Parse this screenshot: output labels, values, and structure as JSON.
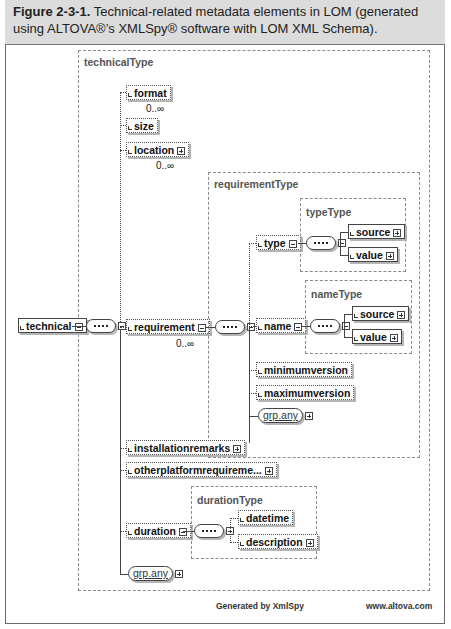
{
  "caption": {
    "figure_label": "Figure 2-3-1.",
    "text": "Technical-related metadata elements in LOM (generated using ALTOVA®’s XMLSpy® software with LOM XML Schema)."
  },
  "diagram": {
    "root": {
      "name": "technical"
    },
    "technicalType": {
      "label": "technicalType",
      "elements": {
        "format": {
          "name": "format",
          "cardinality": "0..∞"
        },
        "size": {
          "name": "size"
        },
        "location": {
          "name": "location",
          "cardinality": "0..∞"
        },
        "requirement": {
          "name": "requirement",
          "cardinality": "0..∞"
        },
        "installationremarks": {
          "name": "installationremarks"
        },
        "otherplatformrequirements": {
          "name": "otherplatformrequireme..."
        },
        "duration": {
          "name": "duration"
        },
        "grp_any": {
          "name": "grp.any"
        }
      }
    },
    "requirementType": {
      "label": "requirementType",
      "elements": {
        "type": {
          "name": "type"
        },
        "name": {
          "name": "name"
        },
        "minimumversion": {
          "name": "minimumversion"
        },
        "maximumversion": {
          "name": "maximumversion"
        },
        "grp_any": {
          "name": "grp.any"
        }
      }
    },
    "typeType": {
      "label": "typeType",
      "source": "source",
      "value": "value"
    },
    "nameType": {
      "label": "nameType",
      "source": "source",
      "value": "value"
    },
    "durationType": {
      "label": "durationType",
      "datetime": "datetime",
      "description": "description"
    }
  },
  "footer": {
    "generated_by": "Generated by XmlSpy",
    "website": "www.altova.com"
  }
}
